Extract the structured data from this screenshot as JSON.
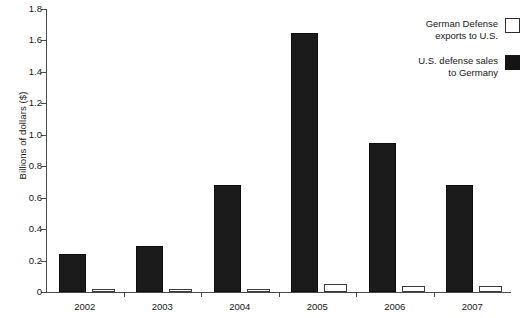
{
  "chart_data": {
    "type": "bar",
    "title": "",
    "subtitle": "",
    "xlabel": "",
    "ylabel": "Billions of dollars ($)",
    "categories": [
      "2002",
      "2003",
      "2004",
      "2005",
      "2006",
      "2007"
    ],
    "series": [
      {
        "name": "German Defense exports to U.S.",
        "color": "#ffffff",
        "style": "hollow",
        "values": [
          0.02,
          0.02,
          0.02,
          0.05,
          0.04,
          0.04
        ]
      },
      {
        "name": "U.S. defense sales to Germany",
        "color": "#1b1b1b",
        "style": "filled",
        "values": [
          0.24,
          0.29,
          0.68,
          1.65,
          0.95,
          0.68
        ]
      }
    ],
    "ylim": [
      0,
      1.8
    ],
    "ytick_labels": [
      "0",
      "0.2",
      "0.4",
      "0.6",
      "0.8",
      "1.0",
      "1.2",
      "1.4",
      "1.6",
      "1.8"
    ],
    "ytick_values": [
      0,
      0.2,
      0.4,
      0.6,
      0.8,
      1.0,
      1.2,
      1.4,
      1.6,
      1.8
    ],
    "grid": false,
    "legend_position": "top-right",
    "bar_order_in_group": [
      "U.S. defense sales to Germany",
      "German Defense exports to U.S."
    ]
  },
  "legend": {
    "entries": [
      {
        "line1": "German Defense",
        "line2": "exports to U.S.",
        "style": "hollow"
      },
      {
        "line1": "U.S. defense sales",
        "line2": "to Germany",
        "style": "filled"
      }
    ]
  },
  "axis": {
    "y_title": "Billions of dollars ($)"
  }
}
